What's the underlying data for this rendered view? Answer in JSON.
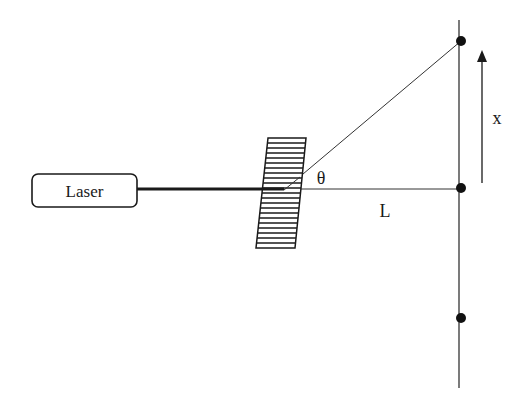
{
  "diagram": {
    "type": "diffraction-grating-setup",
    "labels": {
      "laser": "Laser",
      "angle": "θ",
      "distance": "L",
      "displacement": "x"
    },
    "components": [
      {
        "id": "laser",
        "kind": "box",
        "label": "Laser"
      },
      {
        "id": "beam",
        "kind": "thick-line",
        "from": "laser",
        "to": "grating"
      },
      {
        "id": "grating",
        "kind": "hatched-parallelogram"
      },
      {
        "id": "central-ray",
        "kind": "line",
        "from": "grating",
        "to": "central-spot",
        "label": "L"
      },
      {
        "id": "diffracted-ray",
        "kind": "line",
        "from": "grating",
        "to": "upper-spot",
        "angle_label": "θ"
      },
      {
        "id": "screen",
        "kind": "vertical-line"
      },
      {
        "id": "spots",
        "kind": "dots",
        "count": 3,
        "positions": [
          "upper",
          "central",
          "lower"
        ]
      },
      {
        "id": "x-arrow",
        "kind": "arrow",
        "direction": "up",
        "label": "x"
      }
    ],
    "colors": {
      "stroke": "#1a1a1a",
      "background": "#ffffff"
    }
  }
}
